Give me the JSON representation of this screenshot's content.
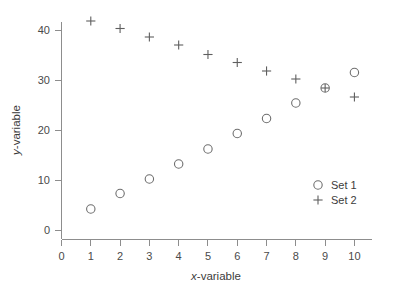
{
  "chart_data": {
    "type": "scatter",
    "title": "",
    "xlabel": "x-variable",
    "ylabel": "y-variable",
    "xlim": [
      0,
      10.6
    ],
    "ylim": [
      0,
      44
    ],
    "xticks": [
      0,
      1,
      2,
      3,
      4,
      5,
      6,
      7,
      8,
      9,
      10
    ],
    "xtick_labels": [
      "0",
      "1",
      "2",
      "3",
      "4",
      "5",
      "6",
      "7",
      "8",
      "9",
      "10"
    ],
    "yticks": [
      0,
      10,
      20,
      30,
      40
    ],
    "ytick_labels": [
      "0",
      "10",
      "20",
      "30",
      "40"
    ],
    "grid": false,
    "legend_position": "lower-right",
    "x": [
      1,
      2,
      3,
      4,
      5,
      6,
      7,
      8,
      9,
      10
    ],
    "series": [
      {
        "name": "Set 1",
        "marker": "circle",
        "color": "#6e6e6e",
        "values": [
          4.2,
          7.3,
          10.2,
          13.2,
          16.2,
          19.3,
          22.3,
          25.4,
          28.4,
          31.5
        ]
      },
      {
        "name": "Set 2",
        "marker": "plus",
        "color": "#5f5f5f",
        "values": [
          41.8,
          40.3,
          38.6,
          37.0,
          35.1,
          33.5,
          31.8,
          30.2,
          28.4,
          26.6
        ]
      }
    ],
    "annotations": [
      "Set 1 and Set 2 overlap at x = 9 (both y = 28.4), drawn as a combined circle-plus marker"
    ]
  },
  "legend": {
    "entries": [
      {
        "label": "Set 1",
        "marker": "circle"
      },
      {
        "label": "Set 2",
        "marker": "plus"
      }
    ]
  },
  "axis": {
    "x_title_italic": "x",
    "x_title_rest": "-variable",
    "y_title_italic": "y",
    "y_title_rest": "-variable"
  },
  "colors": {
    "background": "#ffffff",
    "axis": "#8d8d8d",
    "text": "#3c3c3c",
    "series1": "#6e6e6e",
    "series2": "#5f5f5f"
  }
}
